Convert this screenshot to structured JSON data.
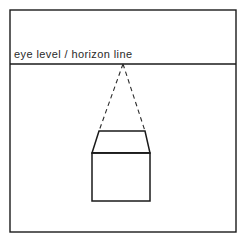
{
  "figure": {
    "background_color": "#ffffff",
    "ink_color": "#1a1a1a",
    "width": 246,
    "height": 243
  },
  "frame": {
    "name": "picture-plane-border",
    "x": 10,
    "y": 10,
    "width": 226,
    "height": 222
  },
  "horizon": {
    "label": "eye level / horizon line",
    "label_x": 14,
    "label_y": 58,
    "line_y": 64,
    "line_x1": 10,
    "line_x2": 236
  },
  "vanishing_point": {
    "label": "vanishing point",
    "x": 123,
    "y": 64
  },
  "sight_lines": [
    {
      "name": "left-sight-line",
      "x1": 123,
      "y1": 64,
      "x2": 99,
      "y2": 131
    },
    {
      "name": "right-sight-line",
      "x1": 123,
      "y1": 64,
      "x2": 145,
      "y2": 131
    }
  ],
  "box": {
    "name": "cube",
    "top_face": {
      "label": "top face",
      "points": "99,131 145,131 150,153 92,153"
    },
    "front_face": {
      "label": "front face",
      "x": 92,
      "y": 153,
      "width": 58,
      "height": 48
    },
    "front_top_edge": {
      "x1": 92,
      "y1": 153,
      "x2": 150,
      "y2": 153
    }
  }
}
